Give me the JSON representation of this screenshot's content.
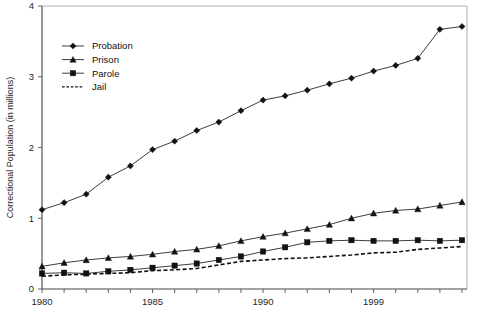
{
  "chart_data": {
    "type": "line",
    "title": "",
    "subtitle": "",
    "xlabel": "",
    "ylabel": "Correctional Population (in millions)",
    "xlim": [
      1980,
      1999
    ],
    "ylim": [
      0,
      4
    ],
    "ytick_labels": [
      "0",
      "1",
      "2",
      "3",
      "4"
    ],
    "ytick_values": [
      0,
      1,
      2,
      3,
      4
    ],
    "xtick_values": [
      1980,
      1981,
      1982,
      1983,
      1984,
      1985,
      1986,
      1987,
      1988,
      1989,
      1990,
      1991,
      1992,
      1993,
      1994,
      1995,
      1996,
      1997,
      1998,
      1999
    ],
    "xtick_labels_shown": [
      "1980",
      "1985",
      "1990",
      "1999"
    ],
    "xtick_labels_shown_at": [
      1980,
      1985,
      1990,
      1995
    ],
    "grid": false,
    "legend_position": "upper-left-inside",
    "x": [
      1980,
      1981,
      1982,
      1983,
      1984,
      1985,
      1986,
      1987,
      1988,
      1989,
      1990,
      1991,
      1992,
      1993,
      1994,
      1995,
      1996,
      1997,
      1998,
      1999
    ],
    "series": [
      {
        "name": "Probation",
        "marker": "diamond",
        "linestyle": "solid",
        "values": [
          1.12,
          1.22,
          1.34,
          1.58,
          1.74,
          1.97,
          2.09,
          2.24,
          2.36,
          2.52,
          2.67,
          2.73,
          2.81,
          2.9,
          2.98,
          3.08,
          3.16,
          3.26,
          3.67,
          3.71
        ]
      },
      {
        "name": "Prison",
        "marker": "triangle",
        "linestyle": "solid",
        "values": [
          0.32,
          0.37,
          0.41,
          0.44,
          0.46,
          0.49,
          0.53,
          0.56,
          0.61,
          0.68,
          0.74,
          0.79,
          0.85,
          0.91,
          1.0,
          1.07,
          1.11,
          1.13,
          1.18,
          1.23
        ]
      },
      {
        "name": "Parole",
        "marker": "square",
        "linestyle": "solid",
        "values": [
          0.22,
          0.23,
          0.22,
          0.25,
          0.27,
          0.3,
          0.33,
          0.36,
          0.41,
          0.46,
          0.53,
          0.59,
          0.66,
          0.68,
          0.69,
          0.68,
          0.68,
          0.69,
          0.68,
          0.69
        ]
      },
      {
        "name": "Jail",
        "marker": "none",
        "linestyle": "dashed",
        "values": [
          0.18,
          0.2,
          0.21,
          0.22,
          0.23,
          0.26,
          0.27,
          0.29,
          0.34,
          0.39,
          0.41,
          0.43,
          0.44,
          0.46,
          0.48,
          0.51,
          0.52,
          0.56,
          0.58,
          0.6
        ]
      }
    ]
  },
  "legend": {
    "items": [
      {
        "label": "Probation"
      },
      {
        "label": "Prison"
      },
      {
        "label": "Parole"
      },
      {
        "label": "Jail"
      }
    ]
  },
  "caption": {
    "text": ""
  }
}
